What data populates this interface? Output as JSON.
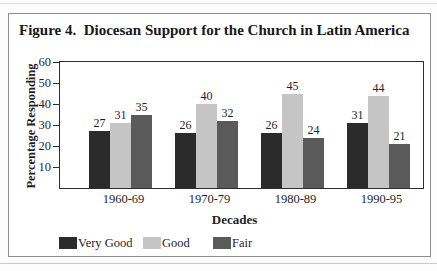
{
  "figure": {
    "title": "Figure 4.  Diocesan Support for the Church in Latin America"
  },
  "chart_data": {
    "type": "bar",
    "title": "Figure 4.  Diocesan Support for the Church in Latin America",
    "categories": [
      "1960-69",
      "1970-79",
      "1980-89",
      "1990-95"
    ],
    "series": [
      {
        "name": "Very Good",
        "color": "#2b2b2b",
        "values": [
          27,
          26,
          26,
          31
        ]
      },
      {
        "name": "Good",
        "color": "#c5c5c5",
        "values": [
          31,
          40,
          45,
          44
        ]
      },
      {
        "name": "Fair",
        "color": "#5a5a5a",
        "values": [
          35,
          32,
          24,
          21
        ]
      }
    ],
    "xlabel": "Decades",
    "ylabel": "Percentage Responding",
    "ylim": [
      0,
      60
    ],
    "yticks": [
      10,
      20,
      30,
      40,
      50,
      60
    ],
    "grid": false,
    "legend_position": "bottom",
    "value_labels": true,
    "colors": {
      "axis_frame": "#2e2e2e",
      "figure_border": "#8e8e8e",
      "text": "#1f1f1f"
    }
  }
}
